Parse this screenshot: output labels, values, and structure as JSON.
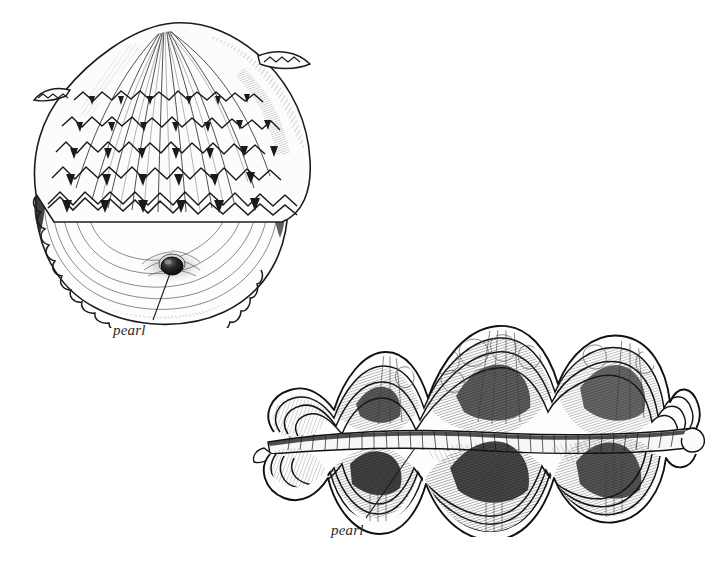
{
  "page": {
    "background_color": "#ffffff",
    "ink_color": "#1c1c1c",
    "width": 715,
    "height": 572,
    "medium": "pen-and-ink scientific illustration"
  },
  "figures": [
    {
      "id": "oyster",
      "name": "pearl-oyster-shell",
      "description": "Pearl oyster shell, partly opened, upper valve with frilled concentric lamellae and radiating ribs, lower valve showing smooth nacre interior with an embedded pearl",
      "position": {
        "x": 14,
        "y": 8,
        "width": 310,
        "height": 320
      },
      "label": {
        "text": "pearl",
        "x": 113,
        "y": 322,
        "leader_from": {
          "x": 172,
          "y": 268
        },
        "leader_to": {
          "x": 153,
          "y": 318
        }
      },
      "pearl_marker": {
        "cx": 172,
        "cy": 266,
        "rx": 11,
        "ry": 9
      }
    },
    {
      "id": "clam",
      "name": "giant-clam-shell",
      "description": "Giant clam with deeply undulating wavy shell margins, open gape with mantle visible, dense cross-hatched shading in the folds, pearl seated in the lower valve",
      "position": {
        "x": 250,
        "y": 312,
        "width": 455,
        "height": 225
      },
      "label": {
        "text": "pearl",
        "x": 331,
        "y": 522,
        "leader_from": {
          "x": 415,
          "y": 448
        },
        "leader_to": {
          "x": 366,
          "y": 518
        }
      }
    }
  ],
  "labels": {
    "oyster_pearl": "pearl",
    "clam_pearl": "pearl"
  }
}
